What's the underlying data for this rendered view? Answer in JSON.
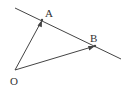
{
  "diagram": {
    "type": "vector-geometry",
    "points": {
      "O": {
        "label": "O"
      },
      "A": {
        "label": "A"
      },
      "B": {
        "label": "B"
      }
    },
    "vectors": [
      {
        "from": "O",
        "to": "A"
      },
      {
        "from": "O",
        "to": "B"
      }
    ],
    "lines": [
      {
        "through": [
          "A",
          "B"
        ],
        "extended": true
      }
    ],
    "colors": {
      "stroke": "#444444",
      "text": "#333333",
      "background": "#ffffff"
    }
  }
}
